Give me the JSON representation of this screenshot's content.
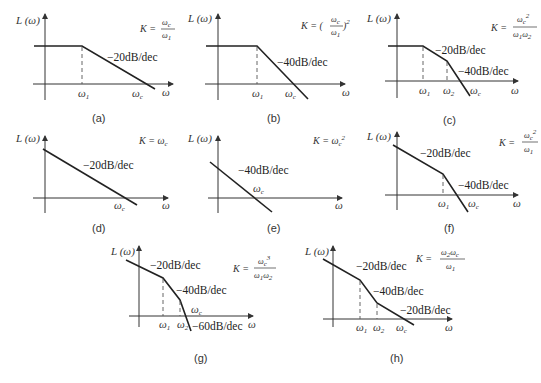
{
  "figure": {
    "y_axis_label": "L (ω)",
    "x_axis_label": "ω",
    "panels": [
      {
        "id": "a",
        "caption": "(a)",
        "gain_formula": "K = ωc/ω1",
        "slopes": [
          "−20dB/dec"
        ],
        "breakpoints": [
          "ω1"
        ],
        "crossover": "ωc",
        "low_freq": "flat"
      },
      {
        "id": "b",
        "caption": "(b)",
        "gain_formula": "K = (ωc/ω1)^2",
        "slopes": [
          "−40dB/dec"
        ],
        "breakpoints": [
          "ω1"
        ],
        "crossover": "ωc",
        "low_freq": "flat"
      },
      {
        "id": "c",
        "caption": "(c)",
        "gain_formula": "K = ωc^2/(ω1ω2)",
        "slopes": [
          "−20dB/dec",
          "−40dB/dec"
        ],
        "breakpoints": [
          "ω1",
          "ω2"
        ],
        "crossover": "ωc",
        "low_freq": "flat"
      },
      {
        "id": "d",
        "caption": "(d)",
        "gain_formula": "K = ωc",
        "slopes": [
          "−20dB/dec"
        ],
        "breakpoints": [],
        "crossover": "ωc",
        "low_freq": "sloped"
      },
      {
        "id": "e",
        "caption": "(e)",
        "gain_formula": "K = ωc^2",
        "slopes": [
          "−40dB/dec"
        ],
        "breakpoints": [],
        "crossover": "ωc",
        "low_freq": "sloped"
      },
      {
        "id": "f",
        "caption": "(f)",
        "gain_formula": "K = ωc^2/ω1",
        "slopes": [
          "−20dB/dec",
          "−40dB/dec"
        ],
        "breakpoints": [
          "ω1"
        ],
        "crossover": "ωc",
        "low_freq": "sloped"
      },
      {
        "id": "g",
        "caption": "(g)",
        "gain_formula": "K = ωc^3/(ω1ω2)",
        "slopes": [
          "−20dB/dec",
          "−40dB/dec",
          "−60dB/dec"
        ],
        "breakpoints": [
          "ω1",
          "ω2"
        ],
        "crossover": "ωc",
        "low_freq": "sloped"
      },
      {
        "id": "h",
        "caption": "(h)",
        "gain_formula": "K = ω2ωc/ω1",
        "slopes": [
          "−20dB/dec",
          "−40dB/dec",
          "−20dB/dec"
        ],
        "breakpoints": [
          "ω1",
          "ω2"
        ],
        "crossover": "ωc",
        "low_freq": "sloped"
      }
    ]
  },
  "labels": {
    "L": "L",
    "omega": "ω",
    "K": "K",
    "eq": "=",
    "s20": "−20dB/dec",
    "s40": "−40dB/dec",
    "s60": "−60dB/dec",
    "ap": "(a)",
    "bp": "(b)",
    "cp": "(c)",
    "dp": "(d)",
    "ep": "(e)",
    "fp": "(f)",
    "gp": "(g)",
    "hp": "(h)",
    "one": "1",
    "two": "2",
    "three": "3",
    "c": "c",
    "paren_open": "(",
    "paren_close": ")"
  }
}
